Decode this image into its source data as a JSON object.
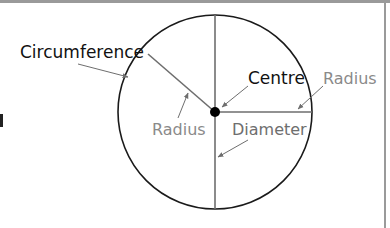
{
  "diagram": {
    "labels": {
      "circumference": "Circumference",
      "centre": "Centre",
      "radius_right": "Radius",
      "radius_left": "Radius",
      "diameter": "Diameter",
      "cutoff_left": "l"
    },
    "colors": {
      "background": "#ffffff",
      "frame": "#9a9a9a",
      "circle": "#1a1a1a",
      "lines": "#6e6e6e",
      "dark_label": "#111111",
      "grey_label": "#8a8a8a",
      "arrow": "#6e6e6e",
      "centre_dot": "#000000"
    },
    "geometry": {
      "center": [
        215,
        112
      ],
      "radius": 97
    }
  }
}
